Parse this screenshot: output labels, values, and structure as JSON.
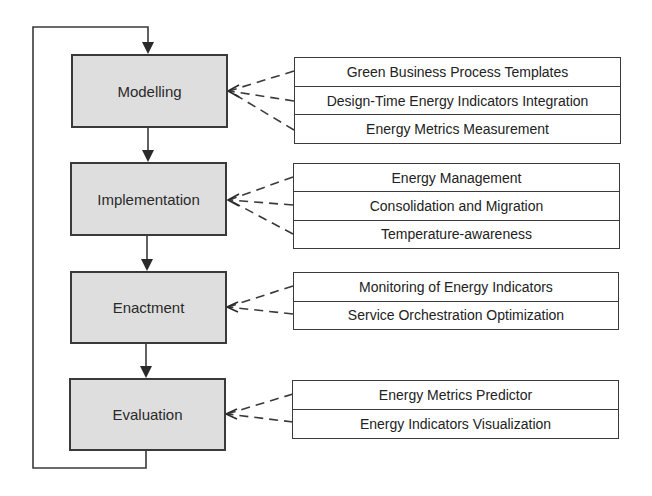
{
  "diagram": {
    "colors": {
      "phase_fill": "#dedede",
      "line": "#3a3a3a",
      "text": "#222222",
      "background": "#ffffff"
    },
    "phases": [
      {
        "label": "Modelling",
        "details": [
          "Green Business Process Templates",
          "Design-Time Energy Indicators Integration",
          "Energy Metrics Measurement"
        ]
      },
      {
        "label": "Implementation",
        "details": [
          "Energy Management",
          "Consolidation and Migration",
          "Temperature-awareness"
        ]
      },
      {
        "label": "Enactment",
        "details": [
          "Monitoring of Energy Indicators",
          "Service Orchestration Optimization"
        ]
      },
      {
        "label": "Evaluation",
        "details": [
          "Energy Metrics Predictor",
          "Energy Indicators Visualization"
        ]
      }
    ],
    "flow": "Modelling → Implementation → Enactment → Evaluation → (loop back to) Modelling"
  }
}
